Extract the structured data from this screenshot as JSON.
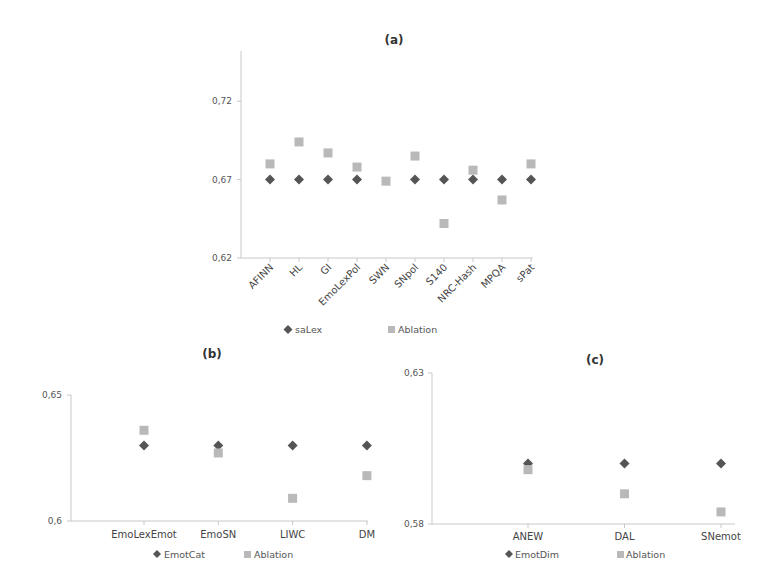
{
  "chart_data": [
    {
      "id": "a",
      "type": "scatter",
      "title": "(a)",
      "xlabel": "",
      "ylabel": "",
      "categories": [
        "AFINN",
        "HL",
        "GI",
        "EmoLexPol",
        "SWN",
        "SNpol",
        "S140",
        "NRC-Hash",
        "MPQA",
        "sPat"
      ],
      "series": [
        {
          "name": "saLex",
          "marker": "diamond",
          "color": "#555555",
          "values": [
            0.67,
            0.67,
            0.67,
            0.67,
            null,
            0.67,
            0.67,
            0.67,
            0.67,
            0.67
          ]
        },
        {
          "name": "Ablation",
          "marker": "square",
          "color": "#b9b9b9",
          "values": [
            0.68,
            0.694,
            0.687,
            0.678,
            0.669,
            0.685,
            0.642,
            0.676,
            0.657,
            0.68
          ]
        }
      ],
      "yticks": [
        "0,62",
        "0,67",
        "0,72"
      ],
      "ytick_values": [
        0.62,
        0.67,
        0.72
      ],
      "ylim": [
        0.62,
        0.752
      ],
      "grid": false,
      "legend_position": "bottom",
      "x_labels_rotated": true
    },
    {
      "id": "b",
      "type": "scatter",
      "title": "(b)",
      "xlabel": "",
      "ylabel": "",
      "categories": [
        "EmoLexEmot",
        "EmoSN",
        "LIWC",
        "DM"
      ],
      "series": [
        {
          "name": "EmotCat",
          "marker": "diamond",
          "color": "#555555",
          "values": [
            0.63,
            0.63,
            0.63,
            0.63
          ]
        },
        {
          "name": "Ablation",
          "marker": "square",
          "color": "#b9b9b9",
          "values": [
            0.636,
            0.627,
            0.609,
            0.618
          ]
        }
      ],
      "yticks": [
        "0,6",
        "0,65"
      ],
      "ytick_values": [
        0.6,
        0.65
      ],
      "ylim": [
        0.6,
        0.65
      ],
      "grid": false,
      "legend_position": "bottom",
      "x_labels_rotated": false
    },
    {
      "id": "c",
      "type": "scatter",
      "title": "(c)",
      "xlabel": "",
      "ylabel": "",
      "categories": [
        "ANEW",
        "DAL",
        "SNemot"
      ],
      "series": [
        {
          "name": "EmotDim",
          "marker": "diamond",
          "color": "#555555",
          "values": [
            0.6,
            0.6,
            0.6
          ]
        },
        {
          "name": "Ablation",
          "marker": "square",
          "color": "#b9b9b9",
          "values": [
            0.598,
            0.59,
            0.584
          ]
        }
      ],
      "yticks": [
        "0,58",
        "0,63"
      ],
      "ytick_values": [
        0.58,
        0.63
      ],
      "ylim": [
        0.58,
        0.63
      ],
      "grid": false,
      "legend_position": "bottom",
      "x_labels_rotated": false
    }
  ]
}
